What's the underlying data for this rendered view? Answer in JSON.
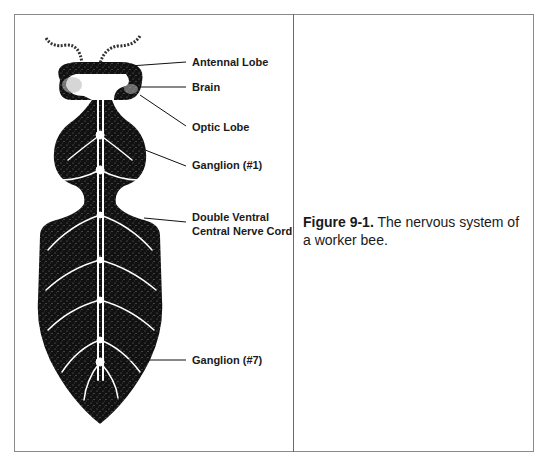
{
  "figure": {
    "labels": [
      {
        "id": "antennal-lobe",
        "text": "Antennal Lobe"
      },
      {
        "id": "brain",
        "text": "Brain"
      },
      {
        "id": "optic-lobe",
        "text": "Optic Lobe"
      },
      {
        "id": "ganglion-1",
        "text": "Ganglion (#1)"
      },
      {
        "id": "nerve-cord-line1",
        "text": "Double Ventral"
      },
      {
        "id": "nerve-cord-line2",
        "text": "Central Nerve Cord"
      },
      {
        "id": "ganglion-7",
        "text": "Ganglion (#7)"
      }
    ],
    "caption": {
      "label": "Figure 9-1.",
      "text": " The nervous system of a worker bee."
    }
  },
  "colors": {
    "body_fill": "#111111",
    "nerves": "#ffffff",
    "border": "#8a8a8a"
  }
}
